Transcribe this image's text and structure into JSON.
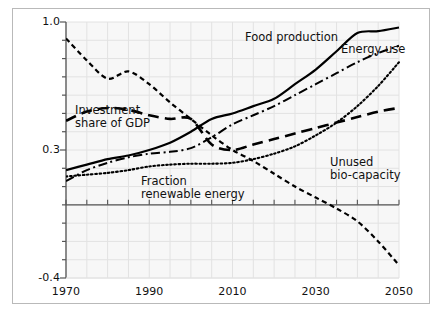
{
  "chart_data": {
    "type": "line",
    "title": "",
    "xlabel": "",
    "ylabel": "",
    "xlim": [
      1970,
      2050
    ],
    "ylim": [
      -0.4,
      1.0
    ],
    "grid": true,
    "legend_position": "inline-annotations",
    "x_ticks": [
      1970,
      1990,
      2010,
      2030,
      2050
    ],
    "x_tick_labels": [
      "1970",
      "1990",
      "2010",
      "2030",
      "2050"
    ],
    "y_ticks": [
      -0.4,
      0.3,
      1.0
    ],
    "y_tick_labels": [
      "-0.4",
      "0.3",
      "1.0"
    ],
    "zero_line": 0.0,
    "x_minor_step": 5,
    "y_minor_step": 0.1,
    "series": [
      {
        "name": "Food production",
        "style": "solid",
        "x": [
          1970,
          1975,
          1980,
          1985,
          1990,
          1995,
          2000,
          2005,
          2010,
          2015,
          2020,
          2025,
          2030,
          2035,
          2040,
          2045,
          2050
        ],
        "values": [
          0.19,
          0.22,
          0.25,
          0.27,
          0.3,
          0.34,
          0.4,
          0.47,
          0.5,
          0.54,
          0.58,
          0.66,
          0.74,
          0.84,
          0.94,
          0.95,
          0.97
        ]
      },
      {
        "name": "Energy use",
        "style": "dash-dot",
        "x": [
          1970,
          1975,
          1980,
          1985,
          1990,
          1995,
          2000,
          2005,
          2010,
          2015,
          2020,
          2025,
          2030,
          2035,
          2040,
          2045,
          2050
        ],
        "values": [
          0.13,
          0.19,
          0.23,
          0.26,
          0.28,
          0.29,
          0.31,
          0.37,
          0.44,
          0.49,
          0.54,
          0.6,
          0.66,
          0.72,
          0.78,
          0.83,
          0.87
        ]
      },
      {
        "name": "Investment share of GDP",
        "style": "long-dash",
        "x": [
          1970,
          1975,
          1980,
          1985,
          1990,
          1995,
          2000,
          2005,
          2010,
          2015,
          2020,
          2025,
          2030,
          2035,
          2040,
          2045,
          2050
        ],
        "values": [
          0.46,
          0.51,
          0.53,
          0.52,
          0.49,
          0.47,
          0.47,
          0.33,
          0.3,
          0.33,
          0.36,
          0.39,
          0.42,
          0.45,
          0.48,
          0.51,
          0.53
        ]
      },
      {
        "name": "Unused bio-capacity",
        "style": "short-dash",
        "x": [
          1970,
          1975,
          1980,
          1985,
          1990,
          1995,
          2000,
          2005,
          2010,
          2015,
          2020,
          2025,
          2030,
          2035,
          2040,
          2045,
          2050
        ],
        "values": [
          0.91,
          0.79,
          0.69,
          0.73,
          0.66,
          0.56,
          0.47,
          0.38,
          0.3,
          0.24,
          0.17,
          0.1,
          0.04,
          -0.02,
          -0.09,
          -0.2,
          -0.33
        ]
      },
      {
        "name": "Fraction renewable energy",
        "style": "dotted",
        "x": [
          1970,
          1975,
          1980,
          1985,
          1990,
          1995,
          2000,
          2005,
          2010,
          2015,
          2020,
          2025,
          2030,
          2035,
          2040,
          2045,
          2050
        ],
        "values": [
          0.155,
          0.165,
          0.175,
          0.19,
          0.21,
          0.22,
          0.225,
          0.225,
          0.23,
          0.25,
          0.28,
          0.32,
          0.38,
          0.45,
          0.54,
          0.65,
          0.78
        ]
      }
    ],
    "annotations": [
      {
        "text": "Food production",
        "x_px": 245,
        "y_px": 31
      },
      {
        "text": "Energy use",
        "x_px": 341,
        "y_px": 43
      },
      {
        "text": "Investment",
        "x_px": 75,
        "y_px": 104
      },
      {
        "text": "share of GDP",
        "x_px": 75,
        "y_px": 117
      },
      {
        "text": "Fraction",
        "x_px": 141,
        "y_px": 175
      },
      {
        "text": "renewable energy",
        "x_px": 141,
        "y_px": 188
      },
      {
        "text": "Unused",
        "x_px": 330,
        "y_px": 156
      },
      {
        "text": "bio-capacity",
        "x_px": 330,
        "y_px": 169
      }
    ],
    "colors": {
      "line": "#000000",
      "grid": "#e2e2e2",
      "axis": "#555555",
      "plot_background": "#f7f7f7",
      "frame_border": "#b9b9b9",
      "text": "#111111"
    }
  }
}
